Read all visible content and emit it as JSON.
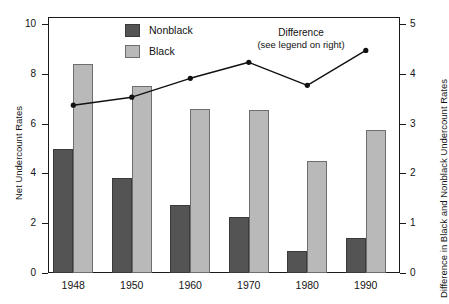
{
  "chart_data": {
    "type": "bar",
    "title": "",
    "xlabel": "",
    "ylabel": "Net Undercount Rates",
    "y2label": "Difference in Black and Nonblack Undercount Rates",
    "categories": [
      "1948",
      "1950",
      "1960",
      "1970",
      "1980",
      "1990"
    ],
    "ylim": [
      0,
      10
    ],
    "y2lim": [
      0,
      5
    ],
    "yticks": [
      "0",
      "2",
      "4",
      "6",
      "8",
      "10"
    ],
    "ytick_values": [
      0,
      2,
      4,
      6,
      8,
      10
    ],
    "y2ticks": [
      "0",
      "1",
      "2",
      "3",
      "4",
      "5"
    ],
    "y2tick_values": [
      0,
      1,
      2,
      3,
      4,
      5
    ],
    "grid": false,
    "legend_position": "upper-left-inside",
    "series": [
      {
        "name": "Nonblack",
        "kind": "bar",
        "axis": "left",
        "color": "#545454",
        "values": [
          5.0,
          3.8,
          2.75,
          2.25,
          0.9,
          1.4
        ]
      },
      {
        "name": "Black",
        "kind": "bar",
        "axis": "left",
        "color": "#b9b9b9",
        "values": [
          8.4,
          7.5,
          6.6,
          6.55,
          4.5,
          5.75
        ]
      },
      {
        "name": "Difference",
        "kind": "line",
        "axis": "right",
        "color": "#111111",
        "values": [
          3.37,
          3.53,
          3.91,
          4.23,
          3.77,
          4.47
        ]
      }
    ],
    "annotations": [
      {
        "text_line1": "Difference",
        "text_line2": "(see legend on right)"
      }
    ]
  },
  "legend": {
    "items": [
      {
        "label": "Nonblack",
        "color": "#545454"
      },
      {
        "label": "Black",
        "color": "#b9b9b9"
      }
    ]
  },
  "annotation": {
    "line1": "Difference",
    "line2": "(see legend on right)"
  },
  "axes": {
    "left_title": "Net Undercount Rates",
    "right_title": "Difference in Black and Nonblack Undercount Rates"
  },
  "colors": {
    "nonblack": "#545454",
    "black": "#b9b9b9",
    "line": "#111111",
    "frame": "#1a1a1a",
    "background": "#ffffff"
  }
}
